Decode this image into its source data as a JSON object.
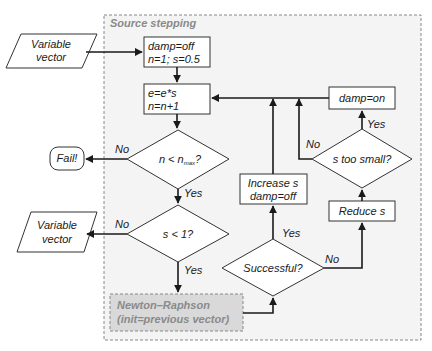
{
  "diagram": {
    "group": {
      "title": "Source stepping"
    },
    "nodes": {
      "input_vector": {
        "lines": [
          "Variable",
          "vector"
        ],
        "shape": "parallelogram"
      },
      "init": {
        "lines": [
          "damp=off",
          "n=1; s=0.5"
        ],
        "shape": "process"
      },
      "update": {
        "lines": [
          "e=e*s",
          "n=n+1"
        ],
        "shape": "process"
      },
      "check_n": {
        "text_prefix": "n < n",
        "text_sub": "max",
        "text_suffix": "?",
        "shape": "decision"
      },
      "fail": {
        "text": "Fail!",
        "shape": "terminal"
      },
      "check_s": {
        "text": "s < 1?",
        "shape": "decision"
      },
      "output_vector": {
        "lines": [
          "Variable",
          "vector"
        ],
        "shape": "parallelogram"
      },
      "newton": {
        "lines": [
          "Newton–Raphson",
          "(init=previous vector)"
        ],
        "shape": "subprocess"
      },
      "successful": {
        "text": "Successful?",
        "shape": "decision"
      },
      "increase": {
        "lines": [
          "Increase s",
          "damp=off"
        ],
        "shape": "process"
      },
      "reduce": {
        "text": "Reduce s",
        "shape": "process"
      },
      "too_small": {
        "text": "s too small?",
        "shape": "decision"
      },
      "damp_on": {
        "text": "damp=on",
        "shape": "process"
      }
    },
    "edge_labels": {
      "n_no": "No",
      "n_yes": "Yes",
      "s_no": "No",
      "s_yes": "Yes",
      "succ_yes": "Yes",
      "succ_no": "No",
      "small_no": "No",
      "small_yes": "Yes"
    },
    "colors": {
      "group_fill": "#f4f4f4",
      "group_border": "#888888",
      "newton_fill": "#d9d9d9",
      "newton_text": "#8a8a8a"
    }
  }
}
